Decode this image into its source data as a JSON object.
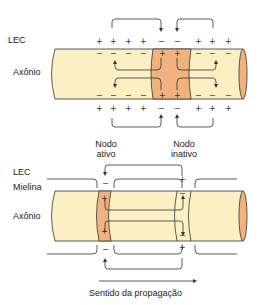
{
  "top_diagram": {
    "labels": {
      "lec": "LEC",
      "axon": "Axônio"
    },
    "outer_top_charges": [
      "+",
      "+",
      "+",
      "+",
      "−",
      "−",
      "+",
      "+",
      "+"
    ],
    "inner_top_charges": [
      "−",
      "−",
      "−",
      "−",
      "+",
      "+",
      "−",
      "−",
      "−"
    ],
    "inner_bottom_charges": [
      "−",
      "−",
      "−",
      "−",
      "+",
      "+",
      "−",
      "−",
      "−"
    ],
    "outer_bottom_charges": [
      "+",
      "+",
      "+",
      "+",
      "−",
      "−",
      "+",
      "+",
      "+"
    ],
    "colors": {
      "axon_fill": "#fbefc4",
      "active_fill": "#f2b27f",
      "stroke": "#333333"
    }
  },
  "bottom_diagram": {
    "labels": {
      "active_node": "Nodo\nativo",
      "active_node_line1": "Nodo",
      "active_node_line2": "ativo",
      "inactive_node_line1": "Nodo",
      "inactive_node_line2": "inativo",
      "lec": "LEC",
      "myelin": "Mielina",
      "axon": "Axônio",
      "direction": "Sentido da propagação"
    },
    "active_node_charges": {
      "outer_top": "−",
      "inner_top": "+",
      "inner_bottom": "+",
      "outer_bottom": "−"
    },
    "inactive_node_charges": {
      "outer_top": "+",
      "inner_top": "−",
      "inner_bottom": "−",
      "outer_bottom": "+"
    }
  }
}
